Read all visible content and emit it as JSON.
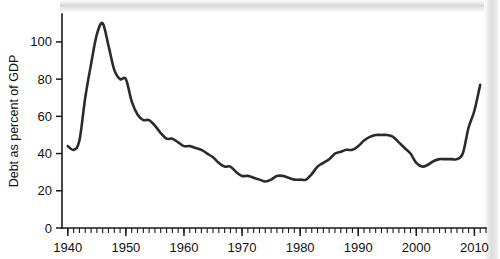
{
  "chart_data": {
    "type": "line",
    "title": "",
    "xlabel": "",
    "ylabel": "Debt as percent of GDP",
    "xlim": [
      1939,
      2012
    ],
    "ylim": [
      0,
      115
    ],
    "grid": false,
    "legend": "none",
    "x_ticks": [
      1940,
      1950,
      1960,
      1970,
      1980,
      1990,
      2000,
      2010
    ],
    "x_tick_labels": [
      "1940",
      "1950",
      "1960",
      "1970",
      "1980",
      "1990",
      "2000",
      "2010"
    ],
    "x_minor_tick_interval": 1,
    "y_ticks": [
      0,
      20,
      40,
      60,
      80,
      100
    ],
    "y_tick_labels": [
      "0",
      "20",
      "40",
      "60",
      "80",
      "100"
    ],
    "line_color": "#2b2b2b",
    "series": [
      {
        "name": "Debt as percent of GDP",
        "x": [
          1940,
          1941,
          1942,
          1943,
          1944,
          1945,
          1946,
          1947,
          1948,
          1949,
          1950,
          1951,
          1952,
          1953,
          1954,
          1955,
          1956,
          1957,
          1958,
          1959,
          1960,
          1961,
          1962,
          1963,
          1964,
          1965,
          1966,
          1967,
          1968,
          1969,
          1970,
          1971,
          1972,
          1973,
          1974,
          1975,
          1976,
          1977,
          1978,
          1979,
          1980,
          1981,
          1982,
          1983,
          1984,
          1985,
          1986,
          1987,
          1988,
          1989,
          1990,
          1991,
          1992,
          1993,
          1994,
          1995,
          1996,
          1997,
          1998,
          1999,
          2000,
          2001,
          2002,
          2003,
          2004,
          2005,
          2006,
          2007,
          2008,
          2009,
          2010,
          2011
        ],
        "values": [
          44,
          42,
          47,
          70,
          88,
          104,
          110,
          98,
          85,
          80,
          80,
          68,
          61,
          58,
          58,
          55,
          51,
          48,
          48,
          46,
          44,
          44,
          43,
          42,
          40,
          38,
          35,
          33,
          33,
          30,
          28,
          28,
          27,
          26,
          25,
          26,
          28,
          28,
          27,
          26,
          26,
          26,
          29,
          33,
          35,
          37,
          40,
          41,
          42,
          42,
          44,
          47,
          49,
          50,
          50,
          50,
          49,
          46,
          43,
          40,
          35,
          33,
          34,
          36,
          37,
          37,
          37,
          37,
          40,
          54,
          63,
          77
        ]
      }
    ]
  },
  "axis": {
    "y_title": "Debt as percent of GDP"
  }
}
